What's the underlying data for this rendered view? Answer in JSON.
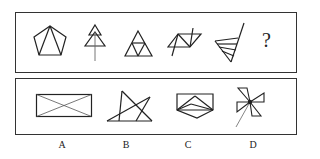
{
  "question_row": {
    "figures": [
      "pentagon-with-two-diagonals",
      "stacked-triangles-tree",
      "subdivided-triangle",
      "parallelogram-with-triangles-and-line",
      "fan-triangles-with-line"
    ],
    "unknown": "?"
  },
  "options": [
    {
      "label": "A",
      "figure": "rectangle-with-diagonals"
    },
    {
      "label": "B",
      "figure": "pentagram-like-star"
    },
    {
      "label": "C",
      "figure": "pentagon-with-inner-triangles"
    },
    {
      "label": "D",
      "figure": "pinwheel-with-line"
    }
  ],
  "colors": {
    "stroke": "#222222",
    "background": "#ffffff"
  }
}
